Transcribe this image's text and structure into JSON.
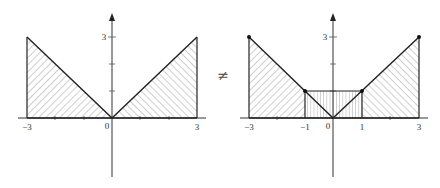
{
  "diagram": {
    "relation_symbol": "≠",
    "left_plot": {
      "description": "Region under y=|x| on [-3,3]",
      "origin_px": [
        112,
        118
      ],
      "unit_px_x": 28.3,
      "unit_px_y": 27,
      "x_labels": [
        {
          "value": -3,
          "text": "−3"
        },
        {
          "value": 0,
          "text": "0"
        },
        {
          "value": 3,
          "text": "3"
        }
      ],
      "y_labels": [
        {
          "value": 3,
          "text": "3"
        }
      ],
      "x_ticks": [
        -3,
        -2,
        -1,
        1,
        2,
        3
      ],
      "y_ticks": [
        1,
        2,
        3
      ],
      "regions": [
        {
          "name": "left-triangle",
          "points": [
            [
              -3,
              0
            ],
            [
              -3,
              3
            ],
            [
              0,
              0
            ]
          ],
          "hatch": "diagonal-forward"
        },
        {
          "name": "right-triangle",
          "points": [
            [
              0,
              0
            ],
            [
              3,
              3
            ],
            [
              3,
              0
            ]
          ],
          "hatch": "diagonal-back"
        }
      ]
    },
    "right_plot": {
      "description": "Riemann-style approximation with midpoint rectangle on [-1,1]",
      "origin_px": [
        333,
        118
      ],
      "unit_px_x": 28.3,
      "unit_px_y": 27,
      "x_labels": [
        {
          "value": -3,
          "text": "−3"
        },
        {
          "value": -1,
          "text": "−1"
        },
        {
          "value": 0,
          "text": "0"
        },
        {
          "value": 1,
          "text": "1"
        },
        {
          "value": 3,
          "text": "3"
        }
      ],
      "y_labels": [
        {
          "value": 3,
          "text": "3"
        }
      ],
      "x_ticks": [
        -3,
        -2,
        -1,
        1,
        2,
        3
      ],
      "y_ticks": [
        1,
        2,
        3
      ],
      "points": [
        [
          -3,
          3
        ],
        [
          -1,
          1
        ],
        [
          1,
          1
        ],
        [
          3,
          3
        ]
      ],
      "regions": [
        {
          "name": "left-trapezoid",
          "points": [
            [
              -3,
              0
            ],
            [
              -3,
              3
            ],
            [
              -1,
              1
            ],
            [
              -1,
              0
            ]
          ],
          "hatch": "diagonal-forward"
        },
        {
          "name": "middle-rectangle",
          "points": [
            [
              -1,
              0
            ],
            [
              -1,
              1
            ],
            [
              1,
              1
            ],
            [
              1,
              0
            ]
          ],
          "hatch": "vertical"
        },
        {
          "name": "right-trapezoid",
          "points": [
            [
              1,
              0
            ],
            [
              1,
              1
            ],
            [
              3,
              3
            ],
            [
              3,
              0
            ]
          ],
          "hatch": "diagonal-back"
        }
      ]
    }
  }
}
